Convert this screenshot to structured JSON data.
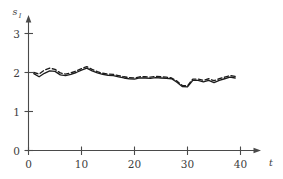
{
  "chart_data": {
    "type": "line",
    "title": "",
    "subtitle": "",
    "xlabel": "t",
    "ylabel": "s",
    "ylabel_subscript": "I",
    "xlim": [
      0,
      43
    ],
    "ylim": [
      0,
      3.4
    ],
    "xticks": [
      0,
      10,
      20,
      30,
      40
    ],
    "xtick_labels": [
      "0",
      "10",
      "20",
      "30",
      "40"
    ],
    "yticks": [
      0,
      1,
      2,
      3
    ],
    "ytick_labels": [
      "0",
      "1",
      "2",
      "3"
    ],
    "grid": false,
    "legend": null,
    "legend_position": "none",
    "annotations": [],
    "x": [
      1,
      2,
      3,
      4,
      5,
      6,
      7,
      8,
      9,
      10,
      11,
      12,
      13,
      14,
      15,
      16,
      17,
      18,
      19,
      20,
      21,
      22,
      23,
      24,
      25,
      26,
      27,
      28,
      29,
      30,
      31,
      32,
      33,
      34,
      35,
      36,
      37,
      38,
      39
    ],
    "series": [
      {
        "name": "solid",
        "style": "solid",
        "color": "#1c1c1c",
        "values": [
          1.97,
          1.89,
          1.98,
          2.04,
          2.03,
          1.94,
          1.92,
          1.95,
          2.0,
          2.06,
          2.11,
          2.04,
          1.99,
          1.95,
          1.93,
          1.92,
          1.89,
          1.86,
          1.84,
          1.83,
          1.86,
          1.86,
          1.85,
          1.87,
          1.86,
          1.85,
          1.84,
          1.75,
          1.64,
          1.63,
          1.8,
          1.8,
          1.76,
          1.8,
          1.74,
          1.8,
          1.84,
          1.88,
          1.86
        ]
      },
      {
        "name": "dashed",
        "style": "dashed",
        "color": "#1c1c1c",
        "values": [
          2.0,
          1.96,
          2.06,
          2.11,
          2.08,
          1.99,
          1.96,
          1.99,
          2.04,
          2.1,
          2.15,
          2.08,
          2.02,
          1.98,
          1.96,
          1.95,
          1.92,
          1.89,
          1.87,
          1.86,
          1.89,
          1.89,
          1.88,
          1.9,
          1.89,
          1.88,
          1.86,
          1.78,
          1.67,
          1.66,
          1.83,
          1.83,
          1.8,
          1.84,
          1.79,
          1.84,
          1.88,
          1.92,
          1.9
        ]
      }
    ]
  },
  "figure": {
    "x_axis_title": "t",
    "y_axis_title": "s",
    "y_axis_subscript": "I"
  }
}
